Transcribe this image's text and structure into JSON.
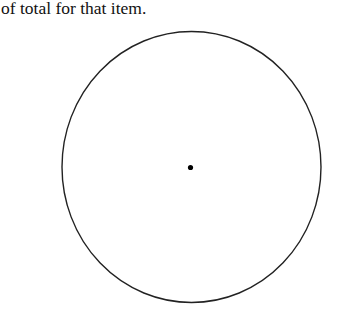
{
  "caption": {
    "text": "of total for that item."
  },
  "diagram": {
    "type": "blank-pie-circle",
    "circle": {
      "cx": 191.5,
      "cy": 167,
      "rx": 129.5,
      "ry": 135.5,
      "stroke": "#222222",
      "stroke_width": 1.4
    },
    "center_dot": {
      "cx": 190.5,
      "cy": 167.5,
      "r": 2.6,
      "fill": "#000000"
    }
  }
}
